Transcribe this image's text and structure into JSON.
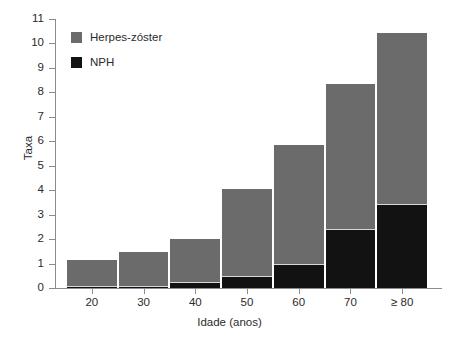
{
  "chart_data": {
    "type": "bar",
    "subtype": "stacked-bar",
    "title": "",
    "xlabel": "Idade (anos)",
    "ylabel": "Taxa",
    "categories": [
      "20",
      "30",
      "40",
      "50",
      "60",
      "70",
      "≥ 80"
    ],
    "series": [
      {
        "name": "Herpes-zóster",
        "color": "#6b6b6b",
        "note": "total bar height (inclui NPH)",
        "values": [
          1.2,
          1.5,
          2.05,
          4.1,
          5.9,
          8.4,
          10.45
        ]
      },
      {
        "name": "NPH",
        "color": "#121212",
        "note": "segmento inferior preto",
        "values": [
          0.02,
          0.03,
          0.25,
          0.5,
          1.0,
          2.4,
          3.45
        ]
      }
    ],
    "ylim": [
      0,
      11
    ],
    "yticks": [
      "0",
      "1",
      "2",
      "3",
      "4",
      "5",
      "6",
      "7",
      "8",
      "9",
      "10",
      "11"
    ],
    "xticks": [
      "20",
      "30",
      "40",
      "50",
      "60",
      "70",
      "≥ 80"
    ],
    "grid": false,
    "legend_position": "upper-left-inside",
    "legend": [
      {
        "label": "Herpes-zóster",
        "color": "#6b6b6b"
      },
      {
        "label": "NPH",
        "color": "#121212"
      }
    ]
  },
  "axes": {
    "y_title": "Taxa",
    "x_title": "Idade (anos)"
  }
}
